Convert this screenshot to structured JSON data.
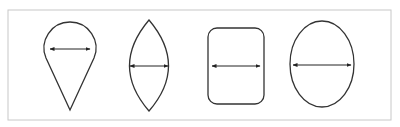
{
  "diagram": {
    "title": "",
    "frame_color": "#c8c8c8",
    "stroke_color": "#333333",
    "shapes": [
      {
        "name": "teardrop",
        "arrow": "horizontal double-headed"
      },
      {
        "name": "lens",
        "arrow": "horizontal double-headed"
      },
      {
        "name": "rounded-rectangle",
        "arrow": "horizontal double-headed"
      },
      {
        "name": "ellipse",
        "arrow": "horizontal double-headed"
      }
    ]
  }
}
